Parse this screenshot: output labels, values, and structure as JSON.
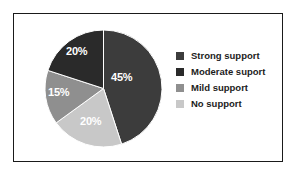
{
  "figure": {
    "background_color": "#ffffff",
    "frame_color": "#1a1a1a",
    "label_text_color": "#ffffff",
    "legend_text_color": "#1c1c1c"
  },
  "chart_data": {
    "type": "pie",
    "title": "",
    "subtitle": "",
    "xlabel": "",
    "ylabel": "",
    "grid": false,
    "legend_position": "right",
    "start_angle_deg": 0,
    "direction": "clockwise",
    "categories": [
      "Strong support",
      "Moderate suport",
      "Mild support",
      "No support"
    ],
    "values": [
      45,
      20,
      15,
      20
    ],
    "value_labels": [
      "45%",
      "20%",
      "15%",
      "20%"
    ],
    "colors": [
      "#3c3c3c",
      "#2a2a2a",
      "#8f8f8f",
      "#c8c8c8"
    ],
    "slices": [
      {
        "label": "Strong support",
        "value": 45,
        "value_label": "45%",
        "color": "#3c3c3c",
        "start_angle_deg": 0,
        "end_angle_deg": 162
      },
      {
        "label": "No support",
        "value": 20,
        "value_label": "20%",
        "color": "#c8c8c8",
        "start_angle_deg": 162,
        "end_angle_deg": 234
      },
      {
        "label": "Mild support",
        "value": 15,
        "value_label": "15%",
        "color": "#8f8f8f",
        "start_angle_deg": 234,
        "end_angle_deg": 288
      },
      {
        "label": "Moderate suport",
        "value": 20,
        "value_label": "20%",
        "color": "#2a2a2a",
        "start_angle_deg": 288,
        "end_angle_deg": 360
      }
    ]
  },
  "legend": {
    "items": [
      {
        "label": "Strong support",
        "color": "#3c3c3c"
      },
      {
        "label": "Moderate suport",
        "color": "#2a2a2a"
      },
      {
        "label": "Mild support",
        "color": "#8f8f8f"
      },
      {
        "label": "No support",
        "color": "#c8c8c8"
      }
    ]
  }
}
